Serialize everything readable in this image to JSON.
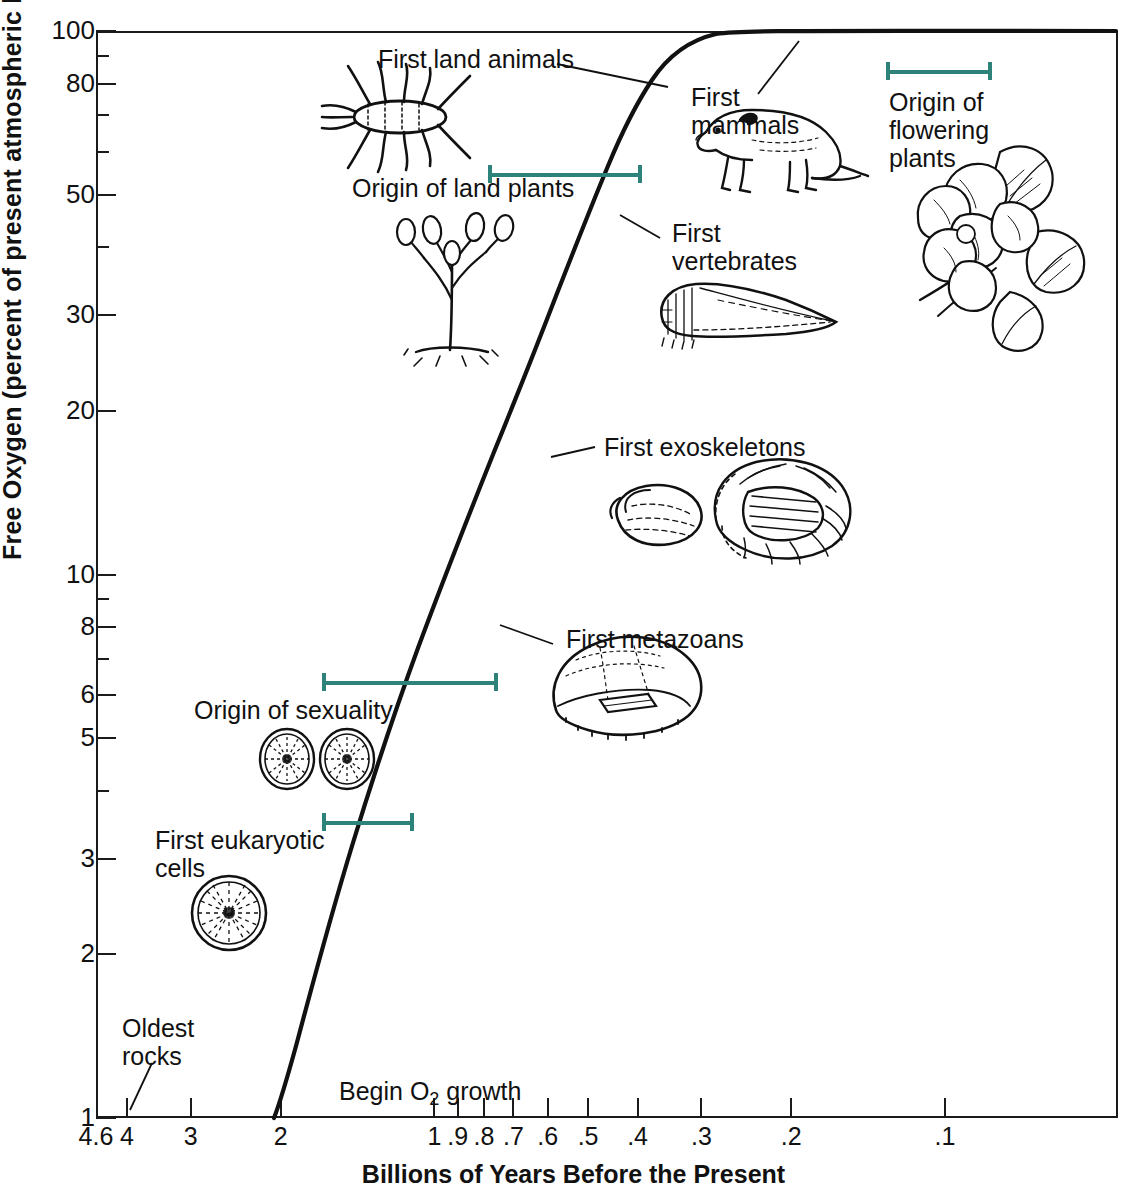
{
  "chart_data": {
    "type": "line",
    "title": "",
    "xlabel": "Billions of Years Before the Present",
    "ylabel": "Free Oxygen (percent of present atmospheric level)",
    "x_scale": "log-reversed",
    "y_scale": "log",
    "xlim": [
      4.6,
      0.05
    ],
    "ylim": [
      1,
      100
    ],
    "grid": false,
    "legend": "none",
    "x_ticks": [
      "4.6",
      "4",
      "3",
      "2",
      "1",
      ".9",
      ".8",
      ".7",
      ".6",
      ".5",
      ".4",
      ".3",
      ".2",
      ".1"
    ],
    "y_ticks": [
      "100",
      "80",
      "50",
      "30",
      "20",
      "10",
      "8",
      "6",
      "5",
      "3",
      "2",
      "1"
    ],
    "y_minor_ticks": [
      "90",
      "70",
      "60",
      "40",
      "9",
      "7",
      "4"
    ],
    "series": [
      {
        "name": "Free oxygen",
        "x": [
          2.0,
          1.9,
          1.8,
          1.7,
          1.6,
          1.5,
          1.4,
          1.3,
          1.2,
          1.1,
          1.0,
          0.9,
          0.8,
          0.7,
          0.6,
          0.5,
          0.45,
          0.4,
          0.37,
          0.34,
          0.3,
          0.25,
          0.2,
          0.15,
          0.1,
          0.05
        ],
        "y": [
          1.0,
          1.1,
          1.25,
          1.45,
          1.7,
          2.0,
          2.4,
          2.9,
          3.4,
          4.1,
          5.0,
          6.0,
          7.2,
          8.6,
          11.0,
          16.0,
          21.0,
          30.0,
          41.0,
          56.0,
          76.0,
          92.0,
          98.0,
          99.5,
          100.0,
          100.0
        ]
      }
    ],
    "annotations": [
      {
        "label": "First land animals",
        "x": 0.43,
        "y": 88
      },
      {
        "label": "First mammals",
        "x": 0.26,
        "y": 78
      },
      {
        "label": "Origin of flowering plants",
        "x": 0.12,
        "y": 80
      },
      {
        "label": "Origin of land plants",
        "x": 1.05,
        "y": 52
      },
      {
        "label": "First vertebrates",
        "x": 0.44,
        "y": 42
      },
      {
        "label": "First exoskeletons",
        "x": 0.58,
        "y": 16
      },
      {
        "label": "First metazoans",
        "x": 0.72,
        "y": 7.5
      },
      {
        "label": "Origin of sexuality",
        "x": 1.55,
        "y": 5.3
      },
      {
        "label": "First eukaryotic cells",
        "x": 2.6,
        "y": 3.2
      },
      {
        "label": "Oldest rocks",
        "x": 3.9,
        "y": 1.35
      },
      {
        "label": "Begin O2 growth",
        "x": 1.75,
        "y": 1.12
      }
    ],
    "range_bars": [
      {
        "label": "Origin of flowering plants",
        "from": 0.16,
        "to": 0.09,
        "y": 85
      },
      {
        "label": "Origin of land plants",
        "from": 1.05,
        "to": 0.4,
        "y": 53
      },
      {
        "label": "Origin of sexuality",
        "from": 1.6,
        "to": 0.8,
        "y": 6.2
      },
      {
        "label": "First eukaryotic cells",
        "from": 1.6,
        "to": 1.15,
        "y": 3.4
      }
    ]
  },
  "axes": {
    "y_title": "Free Oxygen (percent of present atmospheric level)",
    "x_title": "Billions of Years Before the Present",
    "y_ticks": [
      {
        "label": "100",
        "value": 100,
        "major": true
      },
      {
        "label": "",
        "value": 90,
        "major": false
      },
      {
        "label": "80",
        "value": 80,
        "major": true
      },
      {
        "label": "",
        "value": 70,
        "major": false
      },
      {
        "label": "",
        "value": 60,
        "major": false
      },
      {
        "label": "50",
        "value": 50,
        "major": true
      },
      {
        "label": "",
        "value": 40,
        "major": false
      },
      {
        "label": "30",
        "value": 30,
        "major": true
      },
      {
        "label": "20",
        "value": 20,
        "major": true
      },
      {
        "label": "10",
        "value": 10,
        "major": true
      },
      {
        "label": "",
        "value": 9,
        "major": false
      },
      {
        "label": "8",
        "value": 8,
        "major": true
      },
      {
        "label": "",
        "value": 7,
        "major": false
      },
      {
        "label": "6",
        "value": 6,
        "major": true
      },
      {
        "label": "5",
        "value": 5,
        "major": true
      },
      {
        "label": "",
        "value": 4,
        "major": false
      },
      {
        "label": "3",
        "value": 3,
        "major": true
      },
      {
        "label": "2",
        "value": 2,
        "major": true
      },
      {
        "label": "1",
        "value": 1,
        "major": true
      }
    ],
    "x_ticks": [
      {
        "label": "4.6",
        "value": 4.6
      },
      {
        "label": "4",
        "value": 4
      },
      {
        "label": "3",
        "value": 3
      },
      {
        "label": "2",
        "value": 2
      },
      {
        "label": "1",
        "value": 1
      },
      {
        "label": ".9",
        "value": 0.9
      },
      {
        "label": ".8",
        "value": 0.8
      },
      {
        "label": ".7",
        "value": 0.7
      },
      {
        "label": ".6",
        "value": 0.6
      },
      {
        "label": ".5",
        "value": 0.5
      },
      {
        "label": ".4",
        "value": 0.4
      },
      {
        "label": ".3",
        "value": 0.3
      },
      {
        "label": ".2",
        "value": 0.2
      },
      {
        "label": ".1",
        "value": 0.1
      }
    ]
  },
  "labels": {
    "first_land_animals": "First land animals",
    "first_mammals": "First\nmammals",
    "origin_flowering": "Origin of\nflowering\nplants",
    "origin_land_plants": "Origin of land plants",
    "first_vertebrates": "First\nvertebrates",
    "first_exoskeletons": "First exoskeletons",
    "first_metazoans": "First metazoans",
    "origin_sexuality": "Origin of sexuality",
    "first_eukaryotic": "First eukaryotic\ncells",
    "oldest_rocks": "Oldest\nrocks",
    "begin_o2_growth_pre": "Begin O",
    "begin_o2_growth_sub": "2",
    "begin_o2_growth_post": " growth"
  },
  "colors": {
    "range_bar_teal": "#2d8279",
    "curve_black": "#111111",
    "axis_black": "#1a1a1a",
    "text_black": "#111111",
    "background": "#ffffff"
  },
  "icons": {
    "land_animal": "millipede-illustration",
    "mammal": "shrew-illustration",
    "flowering_plant": "magnolia-flower-illustration",
    "land_plant": "rhyniophyte-plant-illustration",
    "vertebrate": "early-fish-illustration",
    "exoskeleton_brachiopod": "brachiopod-shell-illustration",
    "exoskeleton_trilobite": "trilobite-illustration",
    "metazoan": "ediacaran-metazoan-illustration",
    "sexuality_cells": "paired-acritarch-cells-illustration",
    "eukaryotic_cell": "acritarch-cell-illustration"
  }
}
